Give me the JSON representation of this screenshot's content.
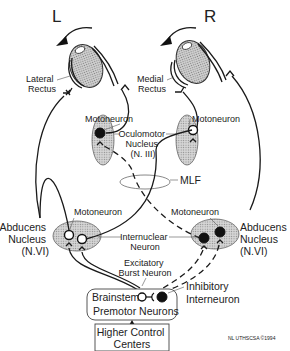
{
  "diagram": {
    "side_labels": {
      "left": "L",
      "right": "R"
    },
    "muscles": {
      "left_eye": [
        "Lateral",
        "Rectus"
      ],
      "right_eye": [
        "Medial",
        "Rectus"
      ]
    },
    "oculomotor": {
      "left_motoneuron": "Motoneuron",
      "right_motoneuron": "Motoneuron",
      "nucleus": [
        "Oculomotor",
        "Nucleus",
        "(N. III)"
      ]
    },
    "mlf": "MLF",
    "abducens": {
      "left_motoneuron": "Motoneuron",
      "right_motoneuron": "Motoneuron",
      "left_nucleus": [
        "Abducens",
        "Nucleus",
        "(N.VI)"
      ],
      "right_nucleus": [
        "Abducens",
        "Nucleus",
        "(N.VI)"
      ],
      "internuclear": [
        "Internuclear",
        "Neuron"
      ]
    },
    "burst": [
      "Excitatory",
      "Burst Neuron"
    ],
    "inhibitory": [
      "Inhibitory",
      "Interneuron"
    ],
    "premotor_box": [
      "Brainstem",
      "Premotor Neurons"
    ],
    "higher_box": [
      "Higher Control",
      "Centers"
    ],
    "credit": "NL  UTHSCSA ©1994",
    "legend_style": {
      "solid_line": "excitatory pathway",
      "dashed_line": "inhibitory pathway",
      "open_cell": "excitatory neuron",
      "filled_cell": "inhibited / inhibitory neuron"
    },
    "colors": {
      "ink": "#1a1a1a",
      "stipple": "#9a9a9a",
      "background": "#ffffff"
    }
  }
}
